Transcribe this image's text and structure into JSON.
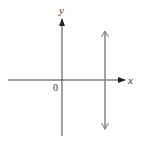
{
  "diagram": {
    "type": "coordinate-axes",
    "axes": {
      "x_label": "x",
      "y_label": "y",
      "origin_label": "0"
    },
    "vertical_line": {
      "description": "double-headed vertical line to the right of the y-axis (x = positive constant)",
      "color": "#8a8a8a",
      "arrows": "both-ends"
    },
    "colors": {
      "axes": "#333333",
      "line": "#8a8a8a",
      "background": "#ffffff"
    }
  }
}
